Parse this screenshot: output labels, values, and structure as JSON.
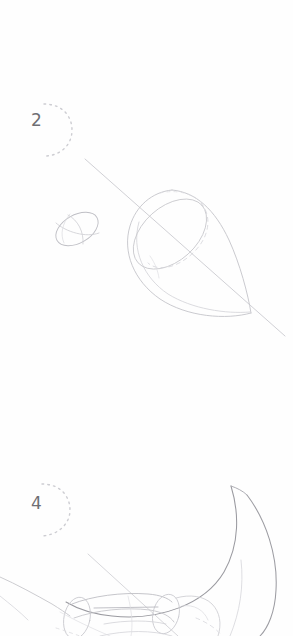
{
  "page": {
    "kind": "pencil-sketch-tutorial-page",
    "background_color": "#fefefe",
    "width": 293,
    "height": 636,
    "media": "graphite pencil on white paper"
  },
  "palette": {
    "paper": "#fefefe",
    "construction_line": "#c2c2c7",
    "faint_line": "#d6d6da",
    "dashed_hidden_line": "#cfcfd4",
    "contour_line": "#8e8e94",
    "number_ink": "#6f6f74",
    "dotted_circle": "#cdcdd2"
  },
  "steps": [
    {
      "number": "2",
      "label_position": {
        "x": 31,
        "y": 112
      },
      "marker": "dotted-circle-around-number",
      "caption": "",
      "shapes": [
        {
          "name": "center-axis-line",
          "type": "straight-line",
          "from": {
            "x": 85,
            "y": 159
          },
          "to": {
            "x": 285,
            "y": 336
          },
          "weight": "light"
        },
        {
          "name": "head-sphere-ellipse",
          "type": "ellipse",
          "center": {
            "x": 77,
            "y": 228
          },
          "rx": 22,
          "ry": 14,
          "rotation_deg": -28,
          "weight": "light"
        },
        {
          "name": "head-longitude-guide",
          "type": "arc",
          "weight": "faint"
        },
        {
          "name": "head-latitude-guide",
          "type": "arc",
          "weight": "faint"
        },
        {
          "name": "body-teardrop",
          "type": "teardrop",
          "wide_end": {
            "x": 150,
            "y": 215
          },
          "tip": {
            "x": 250,
            "y": 313
          },
          "weight": "light"
        },
        {
          "name": "body-cross-section-ellipse",
          "type": "ellipse",
          "center": {
            "x": 169,
            "y": 233
          },
          "rx": 42,
          "ry": 26,
          "rotation_deg": -40,
          "weight": "light"
        },
        {
          "name": "body-hidden-section-curve",
          "type": "dashed-arc",
          "weight": "dashed"
        },
        {
          "name": "body-inner-contour",
          "type": "curve",
          "weight": "faint"
        }
      ]
    },
    {
      "number": "4",
      "label_position": {
        "x": 31,
        "y": 495
      },
      "marker": "dotted-circle-around-number",
      "caption": "",
      "shapes": [
        {
          "name": "wing-crescent-outer",
          "type": "curve",
          "from": {
            "x": 232,
            "y": 487
          },
          "to": {
            "x": 258,
            "y": 636
          },
          "weight": "medium"
        },
        {
          "name": "wing-crescent-inner",
          "type": "curve",
          "from": {
            "x": 232,
            "y": 490
          },
          "to": {
            "x": 60,
            "y": 612
          },
          "weight": "medium"
        },
        {
          "name": "wing-tip-flick",
          "type": "curve",
          "weight": "light"
        },
        {
          "name": "limb-guide-line",
          "type": "straight-line",
          "from": {
            "x": 88,
            "y": 556
          },
          "to": {
            "x": 175,
            "y": 636
          },
          "weight": "faint"
        },
        {
          "name": "limb-cylinder-upper",
          "type": "cylinder",
          "weight": "light"
        },
        {
          "name": "limb-cylinder-lower",
          "type": "cylinder",
          "weight": "light"
        },
        {
          "name": "joint-circle",
          "type": "ellipse",
          "center": {
            "x": 78,
            "y": 618
          },
          "rx": 22,
          "ry": 20,
          "weight": "light"
        },
        {
          "name": "haunch-curve",
          "type": "curve",
          "weight": "light"
        },
        {
          "name": "body-underside-sweep",
          "type": "curve",
          "from": {
            "x": 0,
            "y": 578
          },
          "to": {
            "x": 70,
            "y": 612
          },
          "weight": "light"
        },
        {
          "name": "tail-hidden-dashes",
          "type": "dashed-arc",
          "weight": "dashed"
        }
      ]
    }
  ],
  "annotations": {
    "step2_alt": "Construction geometry: small sphere for head and large teardrop body pierced by a single center axis line.",
    "step4_alt": "Large crescent wing sweeping from top right, with cylindrical limb and joint construction shapes along the bottom edge."
  }
}
